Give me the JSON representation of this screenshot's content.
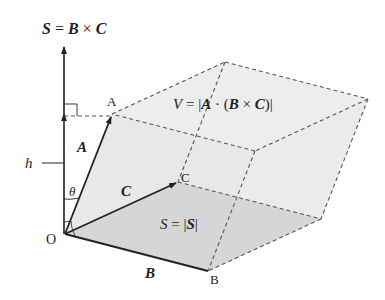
{
  "diagram": {
    "labels": {
      "s_vector_eq": {
        "lhs": "S",
        "eq": " = ",
        "b": "B",
        "times": " × ",
        "c": "C"
      },
      "volume_eq": {
        "v": "V",
        "eq": " = |",
        "a": "A",
        "dot": " · (",
        "b": "B",
        "times": " × ",
        "c": "C",
        "close": ")|"
      },
      "area_eq": {
        "s": "S",
        "eq": " = |",
        "sv": "S",
        "close": "|"
      },
      "vector_a": "A",
      "vector_b": "B",
      "vector_c": "C",
      "point_o": "O",
      "point_a": "A",
      "point_b": "B",
      "point_c": "C",
      "height": "h",
      "angle": "θ"
    },
    "colors": {
      "line": "#222222",
      "dash": "#555555",
      "top_face": "#ececec",
      "base_face": "#d9d9d9",
      "side_face": "#e4e4e4"
    }
  }
}
